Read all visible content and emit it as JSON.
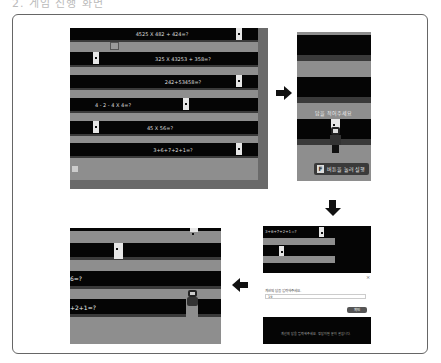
{
  "header": {
    "title": "2. 게임 진행 화면"
  },
  "panels": {
    "top_left": {
      "name": "math-lane-game-overview",
      "equations": [
        "4525 X 482 + 424=?",
        "325 X 43253 + 358=?",
        "242+53458=?",
        "4 - 2 - 4 X 4=?",
        "45 X 56=?",
        "3+6+7+2+1=?"
      ]
    },
    "top_right": {
      "name": "character-approach-view",
      "speech": "답을 적어주세요",
      "button_key": "F",
      "button_label": "버튼을 눌러 실행"
    },
    "bottom_right": {
      "name": "answer-input-dialog",
      "equation_snippet": "3+6+7+2+1=?",
      "close_label": "×",
      "prompt_label": "계산의 답을 입력해주세요.",
      "input_value": "19",
      "submit_label": "확인",
      "footer_text": "계산의 답을 입력해주세요. 정답이면 문이 열립니다."
    },
    "bottom_left": {
      "name": "door-open-result-view",
      "equations": [
        "6=?",
        "+2+1=?"
      ]
    }
  },
  "colors": {
    "lane_black": "#050505",
    "lane_gray": "#8e8e8e",
    "lane_dark": "#3a3a3a",
    "rail": "#6a6a6a",
    "door": "#e6e6e6",
    "arrow": "#111111"
  }
}
